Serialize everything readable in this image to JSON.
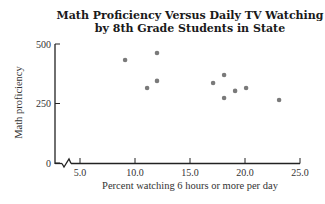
{
  "chart_data": {
    "type": "scatter",
    "title_lines": [
      "Math Proficiency Versus Daily TV Watching",
      "by 8th Grade Students in State"
    ],
    "xlabel": "Percent watching 6 hours or more per day",
    "ylabel": "Math proficiency",
    "xlim": [
      5.0,
      25.0
    ],
    "ylim": [
      0,
      500
    ],
    "x_ticks": [
      "5.0",
      "10.0",
      "15.0",
      "20.0",
      "25.0"
    ],
    "y_ticks": [
      "0",
      "250",
      "500"
    ],
    "x_axis_break": true,
    "grid": false,
    "legend": null,
    "point_color": "#7a7a7a",
    "points": [
      {
        "x": 9.1,
        "y": 433
      },
      {
        "x": 11.1,
        "y": 315
      },
      {
        "x": 12.0,
        "y": 462
      },
      {
        "x": 12.0,
        "y": 345
      },
      {
        "x": 17.1,
        "y": 336
      },
      {
        "x": 18.1,
        "y": 370
      },
      {
        "x": 18.1,
        "y": 273
      },
      {
        "x": 19.1,
        "y": 303
      },
      {
        "x": 20.1,
        "y": 315
      },
      {
        "x": 23.1,
        "y": 265
      }
    ]
  }
}
